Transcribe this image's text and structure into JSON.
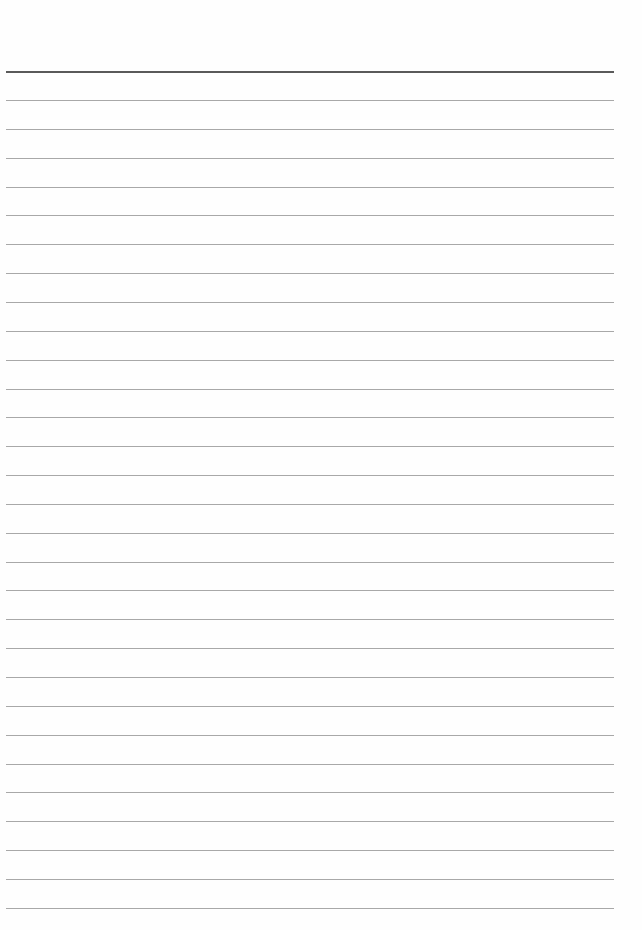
{
  "document": {
    "type": "lined-paper",
    "header_rule": {
      "y": 71,
      "color": "#5a5a5a",
      "thickness": 2
    },
    "rules": {
      "count": 29,
      "start_y": 100,
      "spacing": 28.85,
      "color": "#a8a8a8",
      "thickness": 1,
      "left": 6,
      "width": 608
    }
  }
}
